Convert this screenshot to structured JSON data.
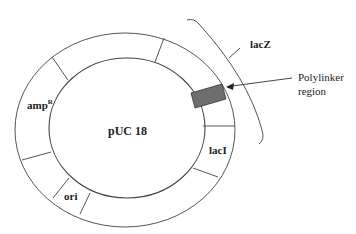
{
  "diagram": {
    "title": "pUC 18",
    "type": "plasmid map",
    "segments": [
      {
        "label": "amp",
        "superscript": "R"
      },
      {
        "label": "ori"
      },
      {
        "label": "lacI"
      },
      {
        "label": "lacZ"
      }
    ],
    "callout": {
      "label_line1": "Polylinker",
      "label_line2": "region"
    },
    "colors": {
      "line": "#555555",
      "polylinker_fill": "#6e6e6e",
      "text": "#222222"
    }
  }
}
